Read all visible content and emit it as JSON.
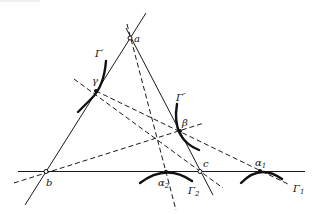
{
  "figure": {
    "colors": {
      "ink": "#111111",
      "background": "#ffffff"
    },
    "vertices": [
      {
        "id": "a",
        "label": "a",
        "x": 130,
        "y": 38
      },
      {
        "id": "b",
        "label": "b",
        "x": 46,
        "y": 172
      },
      {
        "id": "c",
        "label": "c",
        "x": 200,
        "y": 172
      }
    ],
    "points": [
      {
        "id": "gamma",
        "label": "γ",
        "x": 96,
        "y": 91
      },
      {
        "id": "beta",
        "label": "β",
        "x": 180,
        "y": 131
      },
      {
        "id": "alpha1",
        "label": "α",
        "sub": "1",
        "x": 260,
        "y": 171
      },
      {
        "id": "alpha2",
        "label": "α",
        "sub": "2",
        "x": 166,
        "y": 172
      }
    ],
    "curves": [
      {
        "id": "gamma-prime",
        "label": "Γ",
        "sup": "′"
      },
      {
        "id": "gamma-double-prime",
        "label": "Γ",
        "sup": "″"
      },
      {
        "id": "gamma-1",
        "label": "Γ",
        "sub": "1"
      },
      {
        "id": "gamma-2",
        "label": "Γ",
        "sub": "2"
      }
    ]
  }
}
